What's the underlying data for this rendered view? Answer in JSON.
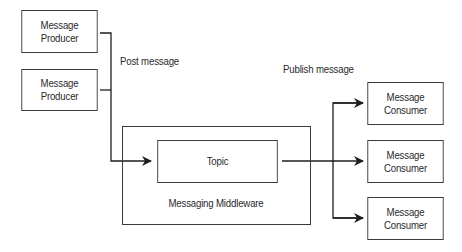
{
  "producers": [
    {
      "line1": "Message",
      "line2": "Producer"
    },
    {
      "line1": "Message",
      "line2": "Producer"
    }
  ],
  "labels": {
    "post": "Post message",
    "publish": "Publish message"
  },
  "middleware": {
    "label": "Messaging Middleware",
    "topic": "Topic"
  },
  "consumers": [
    {
      "line1": "Message",
      "line2": "Consumer"
    },
    {
      "line1": "Message",
      "line2": "Consumer"
    },
    {
      "line1": "Message",
      "line2": "Consumer"
    }
  ],
  "colors": {
    "stroke": "#2a2a2a",
    "background": "#ffffff"
  }
}
